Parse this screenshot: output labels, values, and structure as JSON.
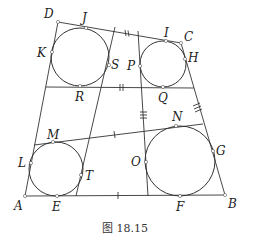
{
  "figure": {
    "caption": "图 18.15",
    "points": {
      "A": "A",
      "B": "B",
      "C": "C",
      "D": "D",
      "E": "E",
      "F": "F",
      "G": "G",
      "H": "H",
      "I": "I",
      "J": "J",
      "K": "K",
      "L": "L",
      "M": "M",
      "N": "N",
      "O": "O",
      "P": "P",
      "Q": "Q",
      "R": "R",
      "S": "S",
      "T": "T"
    },
    "circles": [
      {
        "name": "circle-top-left",
        "tangent_points": [
          "J",
          "K",
          "S",
          "R"
        ]
      },
      {
        "name": "circle-top-right",
        "tangent_points": [
          "I",
          "P",
          "H",
          "Q"
        ]
      },
      {
        "name": "circle-bottom-left",
        "tangent_points": [
          "M",
          "L",
          "T",
          "E"
        ]
      },
      {
        "name": "circle-bottom-right",
        "tangent_points": [
          "N",
          "O",
          "G",
          "F"
        ]
      }
    ],
    "tick_marks": {
      "single": [
        "MN segment",
        "AB segment"
      ],
      "double": [
        "DC segment",
        "RQ segment"
      ],
      "triple": [
        "CB segment",
        "vertical line through P/O"
      ]
    }
  }
}
